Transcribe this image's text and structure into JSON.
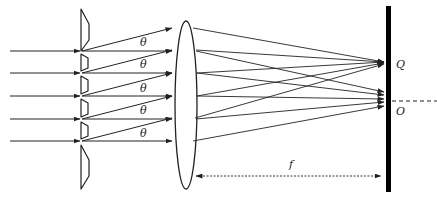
{
  "diagram": {
    "labels": {
      "theta": "θ",
      "Q": "Q",
      "O": "O",
      "f": "f"
    },
    "theta_label_count": 5,
    "colors": {
      "line": "#222222",
      "screen": "#000000",
      "background": "#ffffff"
    },
    "components": [
      {
        "name": "incident-rays",
        "count": 5
      },
      {
        "name": "blazed-grating",
        "description": "sawtooth grating"
      },
      {
        "name": "converging-lens"
      },
      {
        "name": "screen",
        "points": [
          "Q",
          "O"
        ]
      },
      {
        "name": "optical-axis",
        "style": "dashed"
      },
      {
        "name": "focal-length-marker",
        "label": "f"
      }
    ]
  }
}
